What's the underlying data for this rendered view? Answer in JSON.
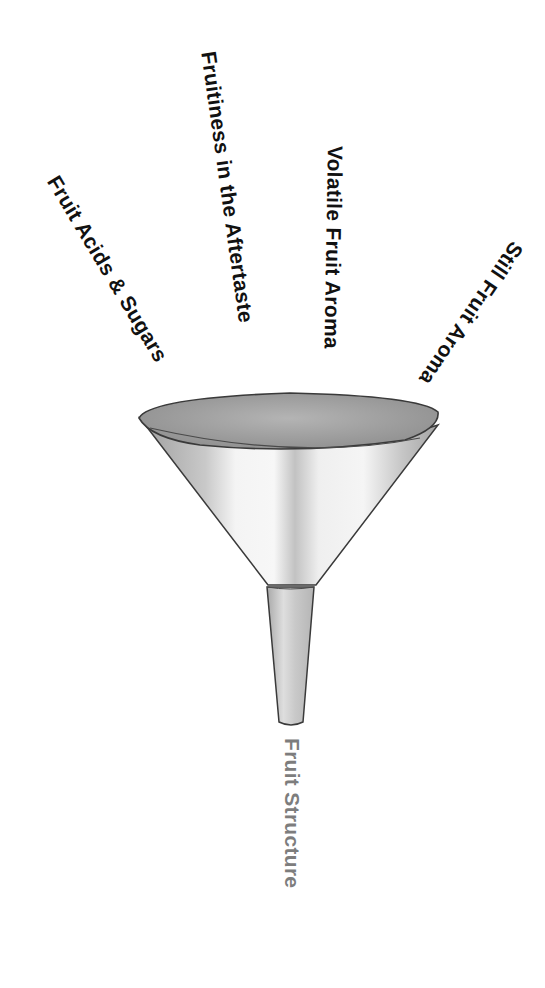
{
  "diagram": {
    "type": "funnel",
    "inputs": [
      {
        "id": "acids",
        "label": "Fruit Acids & Sugars",
        "angle_deg": 59
      },
      {
        "id": "aftertaste",
        "label": "Fruitiness in the Aftertaste",
        "angle_deg": 82
      },
      {
        "id": "volatile",
        "label": "Volatile Fruit Aroma",
        "angle_deg": 91
      },
      {
        "id": "still",
        "label": "Still Fruit Aroma",
        "angle_deg": 124
      }
    ],
    "output": {
      "label": "Fruit Structure",
      "angle_deg": 90
    },
    "colors": {
      "input_text": "#111111",
      "output_text": "#7d7d7d",
      "funnel_rim_fill": "#a9a9a9",
      "funnel_body_fill": "#d8d8d8",
      "funnel_outline": "#3a3a3a",
      "background": "#ffffff"
    }
  }
}
